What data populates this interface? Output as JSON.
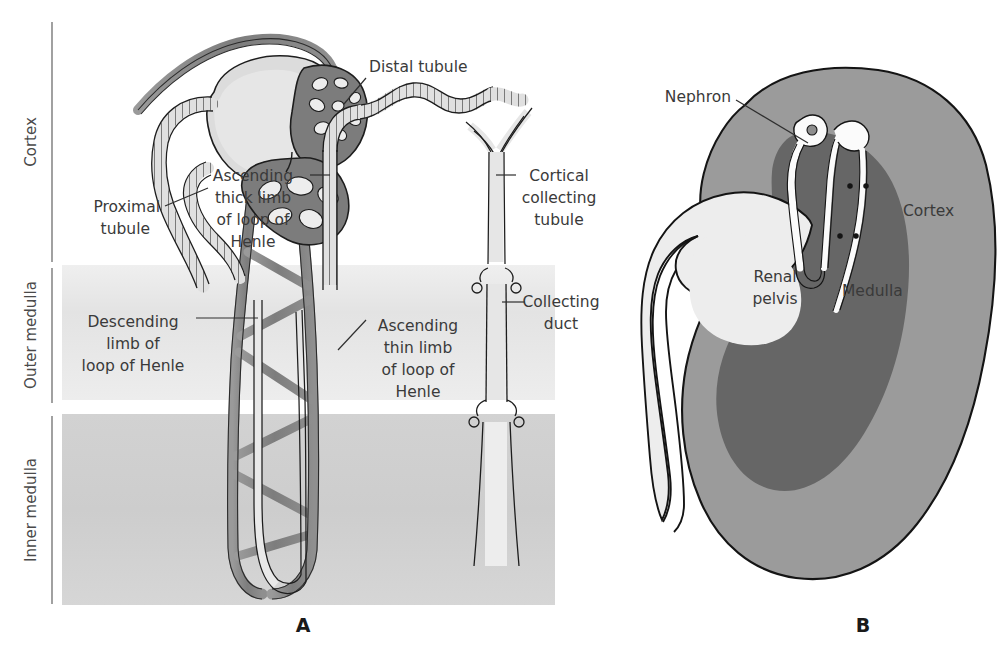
{
  "figure": {
    "background_color": "#ffffff"
  },
  "panels": [
    {
      "id": "A",
      "letter": "A",
      "caption": "Nephron with vasculature in cortex and medulla"
    },
    {
      "id": "B",
      "letter": "B",
      "caption": "Whole kidney section showing nephron position"
    }
  ],
  "panel_a": {
    "letter": "A",
    "zones": [
      {
        "name": "cortex",
        "label": "Cortex",
        "color": "#ffffff",
        "y_top": 18,
        "y_bottom": 263
      },
      {
        "name": "outer-medulla",
        "label": "Outer medulla",
        "color": "#e2e2e2",
        "y_top": 265,
        "y_bottom": 400
      },
      {
        "name": "inner-medulla",
        "label": "Inner medulla",
        "color": "#cfcfcf",
        "y_top": 414,
        "y_bottom": 605
      }
    ],
    "labels": [
      {
        "id": "proximal-tubule",
        "lines": [
          "Proximal",
          "tubule"
        ],
        "anchor": "end",
        "x": 160,
        "y": 212
      },
      {
        "id": "distal-tubule",
        "lines": [
          "Distal tubule"
        ],
        "anchor": "start",
        "x": 369,
        "y": 72
      },
      {
        "id": "ascending-thick-limb",
        "lines": [
          "Ascending",
          "thick limb",
          "of loop of",
          "Henle"
        ],
        "anchor": "middle",
        "x": 253,
        "y": 181
      },
      {
        "id": "cortical-collecting-tubule",
        "lines": [
          "Cortical",
          "collecting",
          "tubule"
        ],
        "anchor": "middle",
        "x": 559,
        "y": 181
      },
      {
        "id": "descending-limb",
        "lines": [
          "Descending",
          "limb of",
          "loop of Henle"
        ],
        "anchor": "middle",
        "x": 133,
        "y": 327
      },
      {
        "id": "ascending-thin-limb",
        "lines": [
          "Ascending",
          "thin limb",
          "of loop of",
          "Henle"
        ],
        "anchor": "middle",
        "x": 418,
        "y": 331
      },
      {
        "id": "collecting-duct",
        "lines": [
          "Collecting",
          "duct"
        ],
        "anchor": "middle",
        "x": 561,
        "y": 307
      }
    ],
    "colors": {
      "vessel_fill": "#8a8a8a",
      "vessel_stroke": "#2b2b2b",
      "tubule_fill": "#dedede",
      "tubule_stroke": "#1d1d1d",
      "capsule_fill": "#d9d9d9",
      "glomerulus_fill": "#7e7e7e"
    }
  },
  "panel_b": {
    "letter": "B",
    "labels": [
      {
        "id": "nephron",
        "lines": [
          "Nephron"
        ],
        "anchor": "end",
        "x": 731,
        "y": 102
      },
      {
        "id": "cortex",
        "lines": [
          "Cortex"
        ],
        "anchor": "start",
        "x": 903,
        "y": 216
      },
      {
        "id": "renal-pelvis",
        "lines": [
          "Renal",
          "pelvis"
        ],
        "anchor": "middle",
        "x": 775,
        "y": 282
      },
      {
        "id": "medulla",
        "lines": [
          "Medulla"
        ],
        "anchor": "start",
        "x": 842,
        "y": 296
      }
    ],
    "colors": {
      "capsule_outline": "#1d1d1d",
      "cortex_fill": "#9b9b9b",
      "medulla_fill": "#6a6a6a",
      "pelvis_fill": "#ededed",
      "nephron_fill": "#fbfbfb"
    }
  }
}
